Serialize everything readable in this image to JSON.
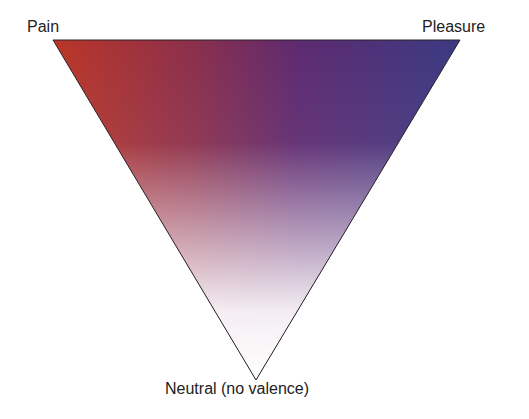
{
  "diagram": {
    "type": "valence-triangle",
    "vertices": {
      "top_left": {
        "label": "Pain",
        "color": "#b8352a"
      },
      "top_right": {
        "label": "Pleasure",
        "color": "#3a3a80"
      },
      "bottom": {
        "label": "Neutral (no valence)",
        "color": "#fbf8fa"
      }
    },
    "top_mid_color": "#6a2a6e"
  }
}
